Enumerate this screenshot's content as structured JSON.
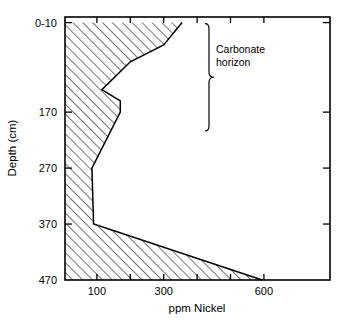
{
  "chart_data": {
    "type": "area",
    "title": "",
    "xlabel": "ppm Nickel",
    "ylabel": "Depth (cm)",
    "orientation": "vertical-depth-profile",
    "grid": false,
    "legend": null,
    "xlim": [
      0,
      700
    ],
    "ylim": [
      0,
      470
    ],
    "y_inverted": true,
    "xticks_labeled": [
      100,
      300,
      600
    ],
    "xtick_labels": [
      "100",
      "300",
      "600"
    ],
    "ytick_labels": [
      "0-10",
      "170",
      "270",
      "370",
      "470"
    ],
    "ytick_values": [
      10,
      170,
      270,
      370,
      470
    ],
    "fill": "diagonal-hatch",
    "series": [
      {
        "name": "ppm Nickel",
        "x": [
          355,
          300,
          200,
          115,
          170,
          170,
          85,
          90,
          595
        ],
        "y": [
          10,
          50,
          80,
          130,
          150,
          170,
          270,
          370,
          470
        ]
      }
    ],
    "annotations": [
      {
        "text_line1": "Carbonate",
        "text_line2": "horizon",
        "marker": "brace",
        "depth_range": [
          10,
          150
        ]
      }
    ]
  },
  "axes": {
    "x_title": "ppm Nickel",
    "y_title": "Depth (cm)"
  },
  "annotation": {
    "line1": "Carbonate",
    "line2": "horizon"
  }
}
